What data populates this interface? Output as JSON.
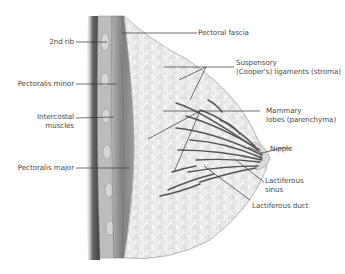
{
  "figure": {
    "labels_left": [
      {
        "id": "2nd-rib",
        "text": "2nd rib"
      },
      {
        "id": "pectoralis-minor",
        "text": "Pectoralis minor"
      },
      {
        "id": "intercostal-muscles",
        "line1": "Intercostal",
        "line2": "muscles"
      },
      {
        "id": "pectoralis-major",
        "text": "Pectoralis major"
      }
    ],
    "labels_right": [
      {
        "id": "pectoral-fascia",
        "text": "Pectoral fascia"
      },
      {
        "id": "suspensory-ligaments",
        "line1": "Suspensory",
        "line2": "(Cooper's) ligaments (stroma)"
      },
      {
        "id": "mammary-lobes",
        "line1": "Mammary",
        "line2": "lobes (parenchyma)"
      },
      {
        "id": "nipple",
        "text": "Nipple"
      },
      {
        "id": "lactiferous-sinus",
        "line1": "Lactiferous",
        "line2": "sinus"
      },
      {
        "id": "lactiferous-duct",
        "text": "Lactiferous duct"
      }
    ],
    "colors": {
      "background": "#ffffff",
      "tissue": "#e6e6e6",
      "muscle": "#8a8a8a",
      "shadow": "#5a5a5a",
      "ducts": "#555555",
      "label_text": "#4a4a4a",
      "leader_lines": "#333333"
    }
  }
}
